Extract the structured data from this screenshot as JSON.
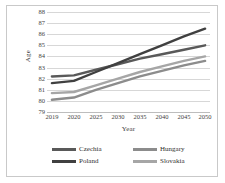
{
  "chart_data": {
    "type": "line",
    "title": "",
    "xlabel": "Year",
    "ylabel": "Age",
    "x": [
      2019,
      2020,
      2025,
      2030,
      2035,
      2040,
      2045,
      2050
    ],
    "xlim": [
      2019,
      2050
    ],
    "ylim": [
      79,
      88
    ],
    "yticks": [
      88,
      87,
      86,
      85,
      84,
      83,
      82,
      81,
      80,
      79
    ],
    "xticks": [
      "2019",
      "2020",
      "2025",
      "2030",
      "2035",
      "2040",
      "2045",
      "2050"
    ],
    "grid": true,
    "legend_position": "bottom",
    "series": [
      {
        "name": "Czechia",
        "color": "#595959",
        "values": [
          82.2,
          82.3,
          82.8,
          83.3,
          83.8,
          84.2,
          84.6,
          85.0
        ]
      },
      {
        "name": "Hungary",
        "color": "#8c8c8c",
        "values": [
          80.1,
          80.3,
          81.0,
          81.6,
          82.2,
          82.7,
          83.2,
          83.6
        ]
      },
      {
        "name": "Poland",
        "color": "#404040",
        "values": [
          81.6,
          81.8,
          82.6,
          83.4,
          84.2,
          85.0,
          85.8,
          86.5
        ]
      },
      {
        "name": "Slovakia",
        "color": "#a6a6a6",
        "values": [
          80.7,
          80.8,
          81.4,
          82.0,
          82.6,
          83.1,
          83.6,
          84.0
        ]
      }
    ]
  },
  "colors": {
    "grid": "#d7d7d7",
    "axis": "#bdbdbd",
    "frame": "#c9c9c9",
    "text": "#3f3f3f",
    "background": "#ffffff"
  }
}
